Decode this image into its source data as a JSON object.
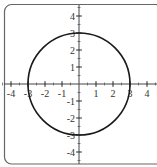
{
  "chart_data": {
    "type": "line",
    "title": "",
    "xlabel": "",
    "ylabel": "",
    "xlim": [
      -4.5,
      4.5
    ],
    "ylim": [
      -4.5,
      4.5
    ],
    "grid": false,
    "axes_through_origin": true,
    "x_ticks": [
      -4,
      -3,
      -2,
      -1,
      1,
      2,
      3,
      4
    ],
    "y_ticks": [
      -4,
      -3,
      -2,
      -1,
      1,
      2,
      3,
      4
    ],
    "x_tick_labels": [
      "-4",
      "-3",
      "-2",
      "-1",
      "1",
      "2",
      "3",
      "4"
    ],
    "y_tick_labels": [
      "-4",
      "-3",
      "-2",
      "-1",
      "1",
      "2",
      "3",
      "4"
    ],
    "minor_tick_step": 0.5,
    "series": [
      {
        "name": "circle",
        "shape": "circle",
        "center": [
          0,
          0
        ],
        "radius": 3,
        "equation": "x^2 + y^2 = 9",
        "color": "#1a1a1a"
      }
    ]
  },
  "style": {
    "frame_color": "#666666",
    "axis_color": "#444444",
    "curve_color": "#1a1a1a"
  }
}
